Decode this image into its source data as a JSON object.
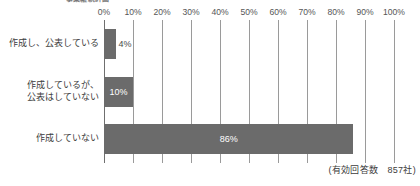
{
  "chart_data": {
    "type": "bar",
    "orientation": "horizontal",
    "title": "事業継続計画",
    "categories": [
      "作成し、公表している",
      "作成しているが、\n公表はしていない",
      "作成していない"
    ],
    "values": [
      4,
      10,
      86
    ],
    "value_labels": [
      "4%",
      "10%",
      "86%"
    ],
    "xlabel": "",
    "ylabel": "",
    "xlim": [
      0,
      100
    ],
    "xticks": [
      0,
      10,
      20,
      30,
      40,
      50,
      60,
      70,
      80,
      90,
      100
    ],
    "xtick_labels": [
      "0%",
      "10%",
      "20%",
      "30%",
      "40%",
      "50%",
      "60%",
      "70%",
      "80%",
      "90%",
      "100%"
    ],
    "grid": true,
    "legend": false,
    "bar_color": "#6b6b6b",
    "grid_color": "#9a9a9a",
    "background": "#ffffff",
    "annotation": "(有効回答数　857社)"
  }
}
